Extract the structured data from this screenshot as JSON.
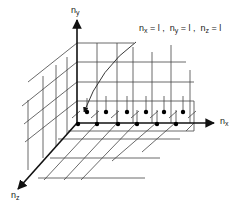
{
  "diagram": {
    "type": "3d-lattice-of-quantum-states",
    "axes": {
      "x": {
        "label_main": "n",
        "label_sub": "x"
      },
      "y": {
        "label_main": "n",
        "label_sub": "y"
      },
      "z": {
        "label_main": "n",
        "label_sub": "z"
      }
    },
    "annotation": {
      "text_parts": [
        {
          "main": "n",
          "sub": "x",
          "rest": " = l ,  "
        },
        {
          "main": "n",
          "sub": "y",
          "rest": " = l ,  "
        },
        {
          "main": "n",
          "sub": "z",
          "rest": " = l"
        }
      ],
      "points_to": "lattice point nearest origin (1,1,1)"
    },
    "lattice_points_visible": 12,
    "colors": {
      "line": "#444444",
      "axis": "#111111",
      "dot": "#000000",
      "background": "#ffffff"
    }
  }
}
